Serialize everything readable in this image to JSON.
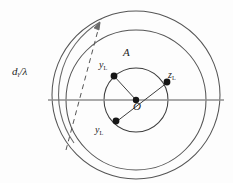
{
  "figure": {
    "background_color": "#fdfdfd",
    "stroke_color": "#4a4a4a",
    "axis_color": "#8a8a8a",
    "marker_color": "#1a1a1a",
    "labels": {
      "distance_arc": "d",
      "distance_arc_sub": "l",
      "distance_arc_frac": "/λ",
      "point_a": "A",
      "center": "O",
      "admittance_top": "y",
      "admittance_top_sub": "L",
      "impedance_right": "z",
      "impedance_right_sub": "L",
      "admittance_bottom": "y",
      "admittance_bottom_sub": "L"
    }
  },
  "geometry": {
    "outer_circle": {
      "cx": 136,
      "cy": 95,
      "r": 84
    },
    "middle_circle": {
      "cx": 136,
      "cy": 100,
      "r": 70
    },
    "inner_circle": {
      "cx": 136,
      "cy": 100,
      "r": 32
    },
    "horizontal_axis": {
      "x1": 48,
      "y1": 100,
      "x2": 224,
      "y2": 100
    },
    "dashed_diameter": {
      "x1": 68,
      "y1": 148,
      "x2": 100,
      "y2": 18
    },
    "chord_upper": {
      "x1": 136,
      "y1": 100,
      "x2": 114,
      "y2": 76
    },
    "chord_lower": {
      "x1": 116,
      "y1": 122,
      "x2": 168,
      "y2": 82
    },
    "markers": [
      {
        "name": "y-sub-L-top",
        "x": 114,
        "y": 76
      },
      {
        "name": "z-sub-L-right",
        "x": 167,
        "y": 82
      },
      {
        "name": "y-sub-L-bottom",
        "x": 116,
        "y": 121
      },
      {
        "name": "center-O",
        "x": 136,
        "y": 100
      }
    ],
    "arc_arrow": {
      "start_x": 75,
      "start_y": 140,
      "end_x": 101,
      "end_y": 20,
      "direction": "counterclockwise-upward"
    }
  }
}
